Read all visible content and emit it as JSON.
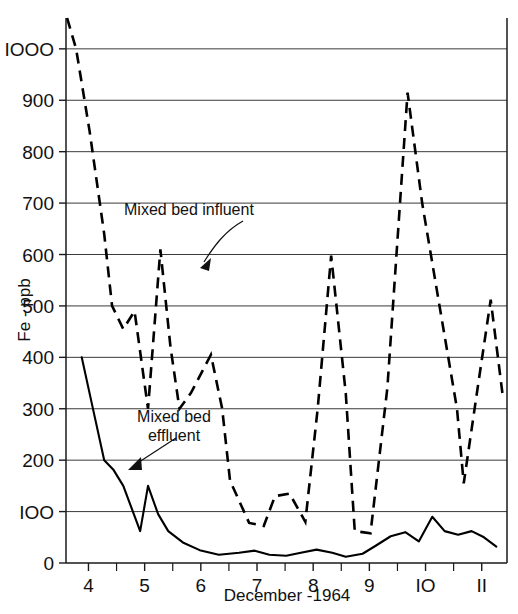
{
  "chart_data": {
    "type": "line",
    "title": "",
    "xlabel": "December -1964",
    "ylabel": "Fe - ppb",
    "xlim": [
      3.6,
      11.45
    ],
    "ylim": [
      0,
      1060
    ],
    "grid": true,
    "legend_position": "inline-annotations",
    "y_ticks": [
      0,
      100,
      200,
      300,
      400,
      500,
      600,
      700,
      800,
      900,
      1000
    ],
    "y_tick_labels": [
      "0",
      "IOO",
      "200",
      "300",
      "400",
      "500",
      "600",
      "700",
      "800",
      "900",
      "IOOO"
    ],
    "x_ticks": [
      4,
      5,
      6,
      7,
      8,
      9,
      10,
      11
    ],
    "x_tick_labels": [
      "4",
      "5",
      "6",
      "7",
      "8",
      "9",
      "IO",
      "II"
    ],
    "x_minor_ticks": [
      4.5,
      5.5,
      6.5,
      7.5,
      8.5,
      9.5,
      10.5
    ],
    "series": [
      {
        "name": "Mixed bed influent",
        "style": "dashed",
        "color": "#000000",
        "x": [
          3.62,
          3.78,
          4.02,
          4.28,
          4.42,
          4.62,
          4.82,
          5.06,
          5.28,
          5.46,
          5.62,
          5.82,
          6.18,
          6.38,
          6.52,
          6.86,
          7.12,
          7.32,
          7.58,
          7.86,
          8.08,
          8.32,
          8.58,
          8.74,
          9.02,
          9.32,
          9.68,
          9.94,
          10.28,
          10.56,
          10.68,
          10.94,
          11.16,
          11.38
        ],
        "y": [
          1060,
          1000,
          840,
          640,
          500,
          455,
          490,
          300,
          610,
          420,
          300,
          330,
          405,
          300,
          160,
          78,
          72,
          130,
          135,
          80,
          300,
          598,
          330,
          62,
          58,
          340,
          915,
          700,
          480,
          300,
          155,
          350,
          512,
          320
        ]
      },
      {
        "name": "Mixed bed effluent",
        "style": "solid",
        "color": "#000000",
        "x": [
          3.88,
          4.06,
          4.28,
          4.44,
          4.62,
          4.92,
          5.06,
          5.24,
          5.42,
          5.68,
          5.98,
          6.32,
          6.68,
          6.96,
          7.22,
          7.52,
          7.78,
          8.06,
          8.34,
          8.58,
          8.88,
          9.12,
          9.38,
          9.64,
          9.88,
          10.12,
          10.34,
          10.58,
          10.82,
          11.04,
          11.26
        ],
        "y": [
          400,
          310,
          200,
          182,
          150,
          62,
          150,
          95,
          62,
          40,
          25,
          16,
          20,
          24,
          16,
          14,
          20,
          26,
          20,
          12,
          18,
          34,
          52,
          60,
          42,
          90,
          62,
          55,
          62,
          50,
          32
        ]
      }
    ],
    "annotations": [
      {
        "id": "influent-label",
        "text_lines": [
          "Mixed bed influent"
        ],
        "text_x": 124,
        "text_y": 215,
        "arrow_path": "M 243 221 C 225 231 214 246 204 262",
        "arrow_head": "200 268 211 258 209 271"
      },
      {
        "id": "effluent-label",
        "text_lines": [
          "Mixed bed",
          "effluent"
        ],
        "text_x": 122,
        "text_y": 422,
        "arrow_path": "M 176 438 C 162 447 150 455 136 464",
        "arrow_head": "128 470 141 457 142 470"
      }
    ]
  }
}
